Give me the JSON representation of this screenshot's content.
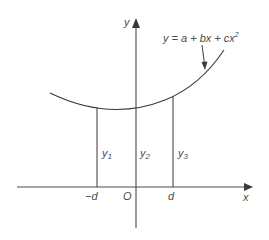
{
  "diagram": {
    "type": "quadratic-curve-ordinates",
    "equation_label": {
      "prefix": "y = a + bx + cx",
      "exponent": "2"
    },
    "axes": {
      "x_label": "x",
      "y_label": "y",
      "origin_label": "O"
    },
    "tick_labels": {
      "minus_d": "−d",
      "plus_d": "d"
    },
    "ordinates": [
      {
        "name": "y",
        "sub": "1",
        "position": "-d"
      },
      {
        "name": "y",
        "sub": "2",
        "position": "0"
      },
      {
        "name": "y",
        "sub": "3",
        "position": "d"
      }
    ],
    "colors": {
      "line": "#4a4a4a",
      "text": "#4a4a4a",
      "background": "#ffffff"
    }
  }
}
